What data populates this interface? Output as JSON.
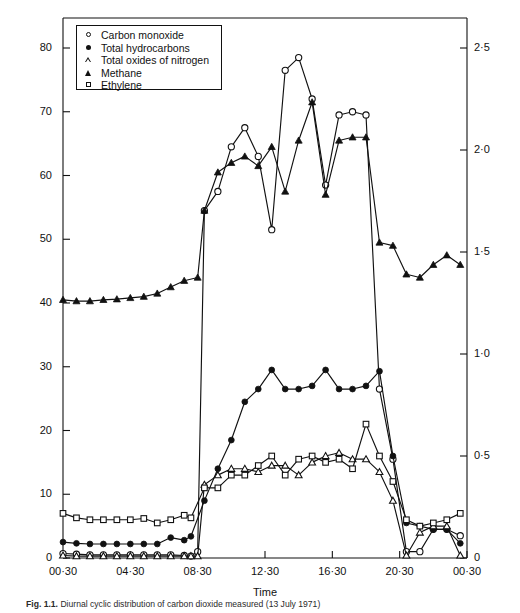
{
  "axes": {
    "y_left_title": "Carbon monoxide and total hydrocarbons (p.p.m.)",
    "y_right_title": "Total oxides of nitrogen, methane and ethylene (p.p.m)",
    "x_title": "Time",
    "y_left_ticks": [
      "0",
      "10",
      "20",
      "30",
      "40",
      "50",
      "60",
      "70",
      "80"
    ],
    "y_right_ticks": [
      "0",
      "0·5",
      "1·0",
      "1·5",
      "2·0",
      "2·5"
    ],
    "x_ticks": [
      "00·30",
      "04·30",
      "08·30",
      "12·30",
      "16·30",
      "20·30",
      "00·30"
    ]
  },
  "legend": {
    "items": [
      {
        "marker": "open-circle",
        "label": "Carbon monoxide"
      },
      {
        "marker": "filled-circle",
        "label": "Total hydrocarbons"
      },
      {
        "marker": "open-triangle",
        "label": "Total oxides of nitrogen"
      },
      {
        "marker": "filled-triangle",
        "label": "Methane"
      },
      {
        "marker": "open-square",
        "label": "Ethylene"
      }
    ]
  },
  "caption": {
    "figure_label": "Fig. 1.1.",
    "text": "Diurnal cyclic distribution of carbon dioxide measured (13 July 1971)"
  },
  "chart_data": {
    "type": "line",
    "title": "",
    "xlabel": "Time",
    "ylabel": "Carbon monoxide and total hydrocarbons (p.p.m.)",
    "y2label": "Total oxides of nitrogen, methane and ethylene (p.p.m)",
    "xlim": [
      0,
      24
    ],
    "ylim": [
      0,
      85
    ],
    "y2lim": [
      0,
      2.65
    ],
    "grid": false,
    "legend_position": "top-left-inside-box",
    "x_tick_values": [
      0,
      4,
      8,
      12,
      16,
      20,
      24
    ],
    "x_tick_labels": [
      "00·30",
      "04·30",
      "08·30",
      "12·30",
      "16·30",
      "20·30",
      "00·30"
    ],
    "y_tick_values": [
      0,
      10,
      20,
      30,
      40,
      50,
      60,
      70,
      80
    ],
    "y2_tick_values": [
      0,
      0.5,
      1.0,
      1.5,
      2.0,
      2.5
    ],
    "note": "x in decimal hours from 00:30; series on left axis: carbon_monoxide, total_hydrocarbons; series on right axis: total_oxides_of_nitrogen, methane, ethylene (values given in left-axis pixel scale equivalents are converted to their own axis units)",
    "series": [
      {
        "name": "Carbon monoxide",
        "marker": "open-circle",
        "axis": "left",
        "unit": "p.p.m.",
        "x": [
          0,
          0.8,
          1.6,
          2.4,
          3.2,
          4.0,
          4.8,
          5.6,
          6.4,
          7.2,
          7.6,
          8.0,
          8.4,
          9.2,
          10.0,
          10.8,
          11.6,
          12.4,
          13.2,
          14.0,
          14.8,
          15.6,
          16.4,
          17.2,
          18.0,
          18.8,
          19.6,
          20.4,
          21.2,
          22.0,
          22.8,
          23.6
        ],
        "y": [
          0.7,
          0.6,
          0.5,
          0.5,
          0.5,
          0.5,
          0.5,
          0.5,
          0.5,
          0.4,
          0.3,
          1.0,
          54.5,
          57.5,
          64.5,
          67.5,
          63.0,
          51.5,
          76.5,
          78.5,
          72.0,
          58.5,
          69.5,
          70.0,
          69.5,
          26.5,
          15.5,
          1.0,
          1.0,
          4.5,
          4.5,
          3.5
        ]
      },
      {
        "name": "Total hydrocarbons",
        "marker": "filled-circle",
        "axis": "left",
        "unit": "p.p.m.",
        "x": [
          0,
          0.8,
          1.6,
          2.4,
          3.2,
          4.0,
          4.8,
          5.6,
          6.4,
          7.2,
          7.6,
          8.4,
          9.2,
          10.0,
          10.8,
          11.6,
          12.4,
          13.2,
          14.0,
          14.8,
          15.6,
          16.4,
          17.2,
          18.0,
          18.8,
          19.6,
          20.4,
          21.2,
          22.0,
          22.8,
          23.6
        ],
        "y": [
          2.5,
          2.3,
          2.2,
          2.2,
          2.2,
          2.2,
          2.2,
          2.2,
          3.2,
          2.8,
          3.4,
          9.0,
          14.0,
          18.5,
          24.5,
          26.5,
          29.5,
          26.5,
          26.5,
          27.0,
          29.5,
          26.5,
          26.5,
          27.0,
          29.3,
          16.0,
          5.5,
          5.0,
          4.5,
          4.5,
          2.3
        ]
      },
      {
        "name": "Total oxides of nitrogen",
        "marker": "open-triangle",
        "axis": "right",
        "unit": "p.p.m.",
        "x": [
          0,
          0.8,
          1.6,
          2.4,
          3.2,
          4.0,
          4.8,
          5.6,
          6.4,
          7.2,
          7.6,
          8.0,
          8.4,
          9.2,
          10.0,
          10.8,
          11.6,
          12.4,
          13.2,
          14.0,
          14.8,
          15.6,
          16.4,
          17.2,
          18.0,
          18.8,
          19.6,
          20.4,
          21.2,
          22.0,
          22.8,
          23.6
        ],
        "y_left_equiv": [
          0.4,
          0.3,
          0.3,
          0.3,
          0.3,
          0.3,
          0.3,
          0.3,
          0.3,
          0.3,
          0.3,
          0.3,
          11.5,
          13.0,
          14.0,
          14.0,
          13.5,
          14.5,
          14.5,
          13.0,
          15.0,
          16.0,
          16.5,
          15.5,
          15.5,
          13.5,
          9.0,
          0.4,
          4.0,
          5.0,
          5.0,
          0.4
        ],
        "y": [
          0.012,
          0.009,
          0.009,
          0.009,
          0.009,
          0.009,
          0.009,
          0.009,
          0.009,
          0.009,
          0.009,
          0.009,
          0.36,
          0.4,
          0.44,
          0.44,
          0.42,
          0.45,
          0.45,
          0.41,
          0.47,
          0.5,
          0.51,
          0.48,
          0.48,
          0.42,
          0.28,
          0.012,
          0.13,
          0.16,
          0.16,
          0.012
        ]
      },
      {
        "name": "Methane",
        "marker": "filled-triangle",
        "axis": "right",
        "unit": "p.p.m.",
        "x": [
          0,
          0.8,
          1.6,
          2.4,
          3.2,
          4.0,
          4.8,
          5.6,
          6.4,
          7.2,
          8.0,
          8.4,
          9.2,
          10.0,
          10.8,
          11.6,
          12.4,
          13.2,
          14.0,
          14.8,
          15.6,
          16.4,
          17.2,
          18.0,
          18.8,
          19.6,
          20.4,
          21.2,
          22.0,
          22.8,
          23.6
        ],
        "y_left_equiv": [
          40.5,
          40.3,
          40.3,
          40.5,
          40.6,
          40.8,
          41.0,
          41.5,
          42.5,
          43.5,
          44.0,
          54.5,
          60.5,
          62.0,
          63.0,
          61.5,
          64.5,
          57.5,
          65.5,
          71.5,
          57.0,
          65.5,
          66.0,
          66.0,
          49.5,
          49.0,
          44.5,
          44.0,
          46.0,
          47.5,
          46.0
        ],
        "y": [
          1.26,
          1.255,
          1.255,
          1.26,
          1.265,
          1.27,
          1.28,
          1.29,
          1.32,
          1.355,
          1.37,
          1.7,
          1.885,
          1.93,
          1.96,
          1.915,
          2.01,
          1.79,
          2.04,
          2.23,
          1.78,
          2.04,
          2.06,
          2.06,
          1.54,
          1.53,
          1.385,
          1.37,
          1.43,
          1.48,
          1.43
        ]
      },
      {
        "name": "Ethylene",
        "marker": "open-square",
        "axis": "right",
        "unit": "p.p.m.",
        "x": [
          0,
          0.8,
          1.6,
          2.4,
          3.2,
          4.0,
          4.8,
          5.6,
          6.4,
          7.2,
          7.6,
          8.4,
          9.2,
          10.0,
          10.8,
          11.6,
          12.4,
          13.2,
          14.0,
          14.8,
          15.6,
          16.4,
          17.2,
          18.0,
          18.8,
          19.6,
          20.4,
          21.2,
          22.0,
          22.8,
          23.6
        ],
        "y_left_equiv": [
          7.0,
          6.3,
          6.0,
          6.0,
          6.0,
          6.0,
          6.2,
          5.5,
          6.0,
          6.7,
          6.3,
          11.0,
          11.0,
          13.0,
          13.0,
          14.5,
          16.0,
          13.0,
          15.5,
          16.0,
          15.0,
          15.5,
          14.0,
          21.0,
          16.0,
          12.0,
          6.0,
          5.0,
          5.5,
          6.0,
          7.0
        ],
        "y": [
          0.22,
          0.195,
          0.19,
          0.19,
          0.19,
          0.19,
          0.195,
          0.17,
          0.19,
          0.21,
          0.195,
          0.345,
          0.345,
          0.405,
          0.405,
          0.455,
          0.5,
          0.405,
          0.485,
          0.5,
          0.47,
          0.485,
          0.44,
          0.655,
          0.5,
          0.375,
          0.19,
          0.155,
          0.17,
          0.19,
          0.22
        ]
      }
    ]
  }
}
